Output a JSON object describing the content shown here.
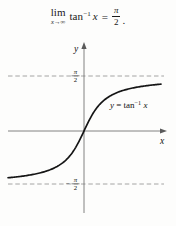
{
  "figure": {
    "formula": {
      "lim": "lim",
      "lim_sub": "x→∞",
      "fn": "tan",
      "fn_sup": "−1",
      "fn_arg": "x",
      "equals": "=",
      "frac_num": "π",
      "frac_den": "2",
      "period": "."
    },
    "graph": {
      "y_axis_label": "y",
      "x_axis_label": "x",
      "top_asymptote_label": {
        "num": "π",
        "den": "2"
      },
      "bottom_asymptote_label": {
        "sign": "−",
        "num": "π",
        "den": "2"
      },
      "curve_label": {
        "y": "y",
        "eq": " = tan",
        "sup": "−1",
        "arg": " x"
      }
    },
    "colors": {
      "axis": "#757575",
      "dashed": "#9a9a9a",
      "curve": "#151515",
      "text": "#000000"
    }
  },
  "chart_data": {
    "type": "line",
    "function": "y = arctan(x)",
    "x_range": [
      -4.75,
      4.81
    ],
    "y_range": [
      -1.5708,
      1.5708
    ],
    "horizontal_asymptotes": [
      1.5708,
      -1.5708
    ],
    "asymptote_labels": [
      "π/2",
      "−π/2"
    ],
    "annotation": "lim (x→∞) tan⁻¹ x = π/2",
    "axis_labels": {
      "x": "x",
      "y": "y"
    },
    "curve_passes_through": [
      0,
      0
    ],
    "grid": false,
    "legend": "none"
  }
}
